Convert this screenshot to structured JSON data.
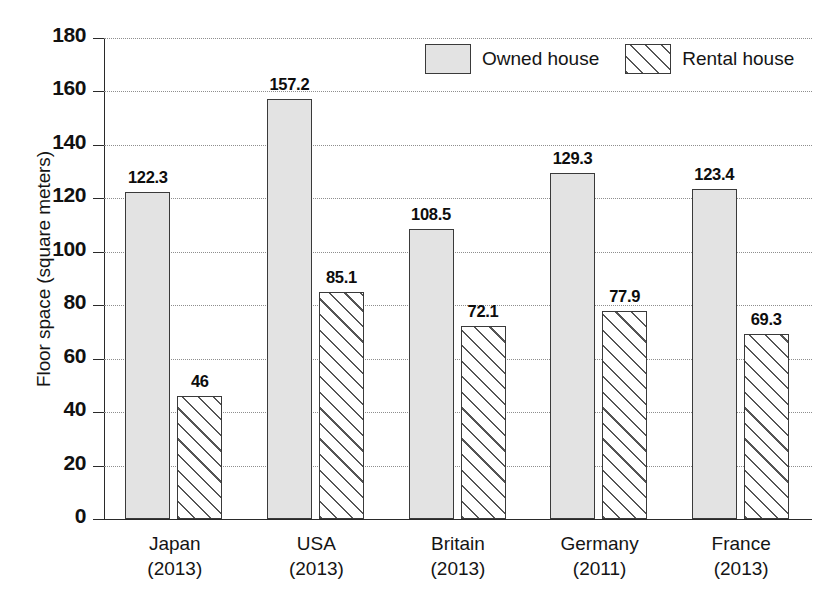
{
  "chart_data": {
    "type": "bar",
    "title": "",
    "subtitle": "",
    "xlabel": "",
    "ylabel": "Floor space (square meters)",
    "ylim": [
      0,
      180
    ],
    "ytick_step": 20,
    "yticks": [
      180,
      160,
      140,
      120,
      100,
      80,
      60,
      40,
      20,
      0
    ],
    "ytick_labels": [
      "180",
      "160",
      "140",
      "120",
      "100",
      "80",
      "60",
      "40",
      "20",
      "0"
    ],
    "grid": "horizontal-dotted",
    "legend_position": "top-center-right",
    "categories": [
      "Japan",
      "USA",
      "Britain",
      "Germany",
      "France"
    ],
    "category_years": [
      "(2013)",
      "(2013)",
      "(2013)",
      "(2011)",
      "(2013)"
    ],
    "category_labels": [
      "Japan\n(2013)",
      "USA\n(2013)",
      "Britain\n(2013)",
      "Germany\n(2011)",
      "France\n(2013)"
    ],
    "series": [
      {
        "name": "Owned house",
        "fill": "solid-light-gray",
        "color": "#e3e3e3",
        "values": [
          122.3,
          157.2,
          108.5,
          129.3,
          123.4
        ],
        "data_labels": [
          "122.3",
          "157.2",
          "108.5",
          "129.3",
          "123.4"
        ]
      },
      {
        "name": "Rental house",
        "fill": "diagonal-hatch",
        "color": "#ffffff",
        "values": [
          46,
          85.1,
          72.1,
          77.9,
          69.3
        ],
        "data_labels": [
          "46",
          "85.1",
          "72.1",
          "77.9",
          "69.3"
        ]
      }
    ],
    "annotations": []
  },
  "legend": {
    "entries": [
      {
        "label": "Owned house",
        "swatch": "solid-light-gray"
      },
      {
        "label": "Rental house",
        "swatch": "diagonal-hatch"
      }
    ]
  },
  "colors": {
    "owned_fill": "#e3e3e3",
    "rental_fill": "#ffffff",
    "bar_outline": "#3a3a3a",
    "axis": "#2a2a2a",
    "gridline": "#8e8e8e",
    "text": "#111111",
    "background": "#ffffff"
  }
}
